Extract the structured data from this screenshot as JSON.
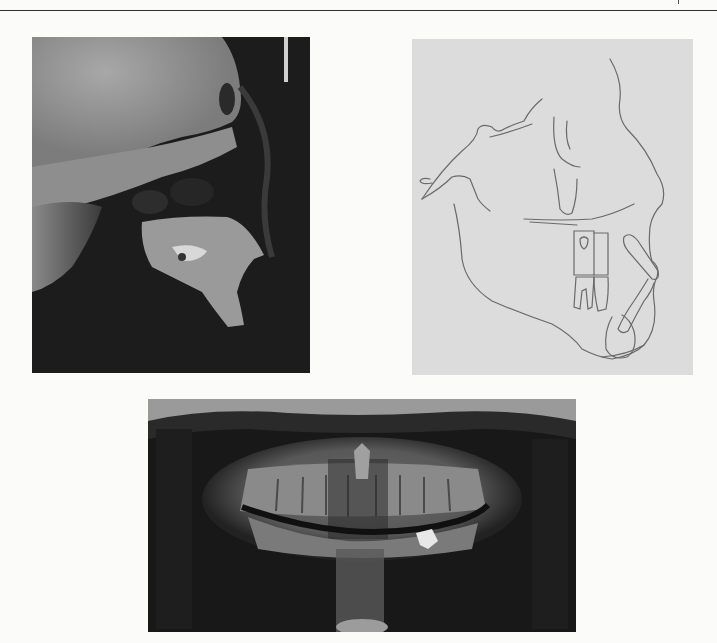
{
  "page": {
    "type": "scanned document page",
    "figures": [
      {
        "id": "lateral-cephalogram",
        "description": "Lateral cephalometric radiograph (profile skull X-ray)"
      },
      {
        "id": "cephalometric-tracing",
        "description": "Cephalometric tracing line drawing of skull profile, teeth and mandible"
      },
      {
        "id": "panoramic-radiograph",
        "description": "Panoramic dental radiograph (orthopantomogram)"
      }
    ]
  },
  "colors": {
    "page": "#fbfbfa",
    "rule": "#2e2e2e",
    "xray_dark": "#1b1b1b",
    "xray_bone": "#9a9a9a",
    "tracing_bg": "#dcdcdc",
    "tracing_line": "#6a6a6a"
  }
}
